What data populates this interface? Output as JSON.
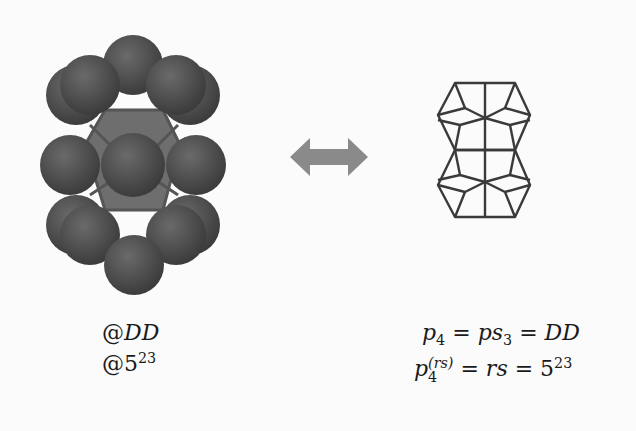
{
  "left": {
    "model": "sphere-cluster-model",
    "labels": [
      {
        "prefix": "@",
        "main": "DD",
        "sup": ""
      },
      {
        "prefix": "@",
        "main": "5",
        "sup": "23"
      }
    ]
  },
  "arrow": {
    "type": "double-headed-arrow",
    "color": "#8a8a8a"
  },
  "right": {
    "model": "wireframe-double-dodecahedron",
    "eq1": {
      "p": "p",
      "p_sub": "4",
      "eq": "=",
      "ps": "ps",
      "ps_sub": "3",
      "eq2": "=",
      "rhs": "DD"
    },
    "eq2": {
      "p": "p",
      "p_sub": "4",
      "p_sup": "(rs)",
      "eq": "=",
      "mid": "rs",
      "eq2": "=",
      "rhs": "5",
      "rhs_sup": "23"
    }
  },
  "colors": {
    "sphere": "#4a4a4a",
    "sphere_highlight": "#6a6a6a",
    "wire": "#3a3a3a",
    "background": "#fbfbfb"
  }
}
